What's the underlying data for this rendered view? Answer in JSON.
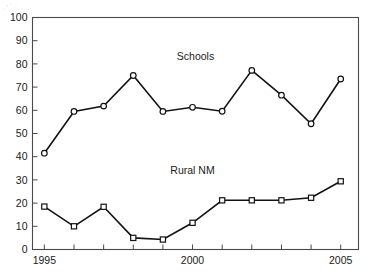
{
  "chart_data": {
    "type": "line",
    "title": "",
    "xlabel": "",
    "ylabel": "",
    "x": [
      1995,
      1996,
      1997,
      1998,
      1999,
      2000,
      2001,
      2002,
      2003,
      2004,
      2005
    ],
    "xlim": [
      1994.6,
      2005.6
    ],
    "ylim": [
      0,
      100
    ],
    "xticks": [
      1995,
      1996,
      1997,
      1998,
      1999,
      2000,
      2001,
      2002,
      2003,
      2004,
      2005
    ],
    "xtick_labels": [
      "1995",
      "",
      "",
      "",
      "",
      "2000",
      "",
      "",
      "",
      "",
      "2005"
    ],
    "yticks": [
      0,
      10,
      20,
      30,
      40,
      50,
      60,
      70,
      80,
      90,
      100
    ],
    "ytick_labels": [
      "0",
      "10",
      "20",
      "30",
      "40",
      "50",
      "60",
      "70",
      "80",
      "90",
      "100"
    ],
    "grid": false,
    "legend_position": "inline-annotation",
    "series": [
      {
        "name": "Schools",
        "marker": "circle",
        "values": [
          41.5,
          59.5,
          61.8,
          75.0,
          59.5,
          61.3,
          59.6,
          77.2,
          66.5,
          54.2,
          73.5
        ],
        "annotation": "Schools",
        "annotation_x": 2000.1,
        "annotation_y": 81.5
      },
      {
        "name": "Rural NM",
        "marker": "square",
        "values": [
          18.5,
          10.0,
          18.4,
          5.0,
          4.3,
          11.5,
          21.2,
          21.2,
          21.2,
          22.3,
          29.4
        ],
        "annotation": "Rural NM",
        "annotation_x": 2000.0,
        "annotation_y": 32.5
      }
    ],
    "colors": {
      "line": "#121212",
      "marker_fill": "#ffffff",
      "axis": "#4a4a4a",
      "text": "#1a1a1a",
      "background": "#ffffff"
    }
  }
}
